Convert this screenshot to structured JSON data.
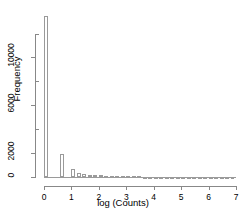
{
  "chart_data": {
    "type": "bar",
    "title": "",
    "subtitle": "",
    "xlabel": "log (Counts)",
    "ylabel": "Frequency",
    "xlim": [
      0,
      7
    ],
    "ylim": [
      0,
      13800
    ],
    "grid": false,
    "legend": null,
    "bin_width": 0.2,
    "x_ticks": [
      {
        "value": 0,
        "label": "0"
      },
      {
        "value": 1,
        "label": "1"
      },
      {
        "value": 2,
        "label": "2"
      },
      {
        "value": 3,
        "label": "3"
      },
      {
        "value": 4,
        "label": "4"
      },
      {
        "value": 5,
        "label": "5"
      },
      {
        "value": 6,
        "label": "6"
      },
      {
        "value": 7,
        "label": "7"
      }
    ],
    "y_ticks": [
      {
        "value": 0,
        "label": "0",
        "major": true
      },
      {
        "value": 2000,
        "label": "2000",
        "major": true
      },
      {
        "value": 4000,
        "label": "",
        "major": false
      },
      {
        "value": 6000,
        "label": "6000",
        "major": true
      },
      {
        "value": 8000,
        "label": "",
        "major": false
      },
      {
        "value": 10000,
        "label": "10000",
        "major": true
      },
      {
        "value": 12000,
        "label": "",
        "major": false
      }
    ],
    "x": [
      0.0,
      0.2,
      0.4,
      0.6,
      0.8,
      1.0,
      1.2,
      1.4,
      1.6,
      1.8,
      2.0,
      2.2,
      2.4,
      2.6,
      2.8,
      3.0,
      3.2,
      3.4,
      3.6,
      3.8,
      4.0,
      4.2,
      4.4,
      4.6,
      4.8,
      5.0,
      5.2,
      5.4,
      5.6,
      5.8,
      6.0,
      6.2,
      6.4,
      6.6,
      6.8
    ],
    "categories": [
      "0.0",
      "0.2",
      "0.4",
      "0.6",
      "0.8",
      "1.0",
      "1.2",
      "1.4",
      "1.6",
      "1.8",
      "2.0",
      "2.2",
      "2.4",
      "2.6",
      "2.8",
      "3.0",
      "3.2",
      "3.4",
      "3.6",
      "3.8",
      "4.0",
      "4.2",
      "4.4",
      "4.6",
      "4.8",
      "5.0",
      "5.2",
      "5.4",
      "5.6",
      "5.8",
      "6.0",
      "6.2",
      "6.4",
      "6.6",
      "6.8"
    ],
    "values": [
      13500,
      0,
      0,
      1900,
      0,
      700,
      300,
      230,
      190,
      160,
      140,
      120,
      105,
      90,
      78,
      66,
      56,
      47,
      40,
      33,
      28,
      23,
      19,
      16,
      13,
      11,
      9,
      7,
      6,
      5,
      4,
      3,
      2,
      2,
      1
    ],
    "series": [
      {
        "name": "Frequency",
        "values": [
          13500,
          0,
          0,
          1900,
          0,
          700,
          300,
          230,
          190,
          160,
          140,
          120,
          105,
          90,
          78,
          66,
          56,
          47,
          40,
          33,
          28,
          23,
          19,
          16,
          13,
          11,
          9,
          7,
          6,
          5,
          4,
          3,
          2,
          2,
          1
        ]
      }
    ],
    "colors": {
      "bar_fill": "#ffffff",
      "bar_border": "#9a9a9a",
      "axis": "#888888",
      "text": "#000000",
      "background": "#ffffff"
    }
  }
}
